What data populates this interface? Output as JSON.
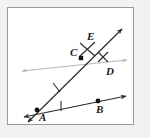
{
  "figure": {
    "background_color": "#f2f2f0",
    "panel_color": "#ffffff",
    "panel_border_color": "#9a9a9a",
    "dark_line_color": "#2b2b2b",
    "light_line_color": "#b5b5b5",
    "point_color": "#111111",
    "label_color": "#1b1b1b",
    "points": [
      {
        "id": "A",
        "label": "A",
        "x": 37,
        "y": 110,
        "marker": "dot",
        "label_dx": 2,
        "label_dy": 2
      },
      {
        "id": "B",
        "label": "B",
        "x": 98,
        "y": 101,
        "marker": "dot",
        "label_dx": -2,
        "label_dy": 3
      },
      {
        "id": "C",
        "label": "C",
        "x": 81,
        "y": 58,
        "marker": "square",
        "label_dx": -11,
        "label_dy": -11
      },
      {
        "id": "D",
        "label": "D",
        "x": 109,
        "y": 62,
        "marker": "none",
        "label_dx": -3,
        "label_dy": 4
      },
      {
        "id": "E",
        "label": "E",
        "x": 91,
        "y": 41,
        "marker": "none",
        "label_dx": -4,
        "label_dy": -10
      }
    ],
    "lines": [
      {
        "id": "ray-A-C-E",
        "name": "ray-from-A-through-C-to-E",
        "color": "dark",
        "from": [
          30,
          120
        ],
        "to": [
          122,
          29
        ],
        "arrow_start": true,
        "arrow_end": true
      },
      {
        "id": "ray-A-B",
        "name": "ray-from-A-through-B",
        "color": "dark",
        "from": [
          24,
          117
        ],
        "to": [
          126,
          96
        ],
        "arrow_start": true,
        "arrow_end": true
      },
      {
        "id": "line-through-C-D",
        "name": "horizontal-line-through-C-and-D",
        "color": "light",
        "from": [
          22,
          71
        ],
        "to": [
          127,
          60
        ],
        "arrow_start": true,
        "arrow_end": true
      }
    ],
    "tick_marks": [
      {
        "id": "tick-AC",
        "name": "congruence-tick-segment-AC",
        "x": 56,
        "y": 88,
        "angle": -44,
        "style": "single"
      },
      {
        "id": "tick-AB",
        "name": "congruence-tick-segment-AB",
        "x": 61,
        "y": 106,
        "angle": -12,
        "style": "single"
      },
      {
        "id": "tick-CE",
        "name": "congruence-cross-near-E",
        "x": 87,
        "y": 49,
        "angle": 0,
        "style": "cross"
      },
      {
        "id": "tick-D",
        "name": "congruence-cross-near-D",
        "x": 103,
        "y": 58,
        "angle": 0,
        "style": "cross"
      }
    ]
  }
}
